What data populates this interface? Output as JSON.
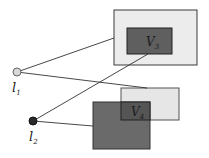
{
  "diagram": {
    "nodes": [
      {
        "id": "l1",
        "label": "l",
        "subscript": "1",
        "fill": "#d8d8d8",
        "cx": 17,
        "cy": 72
      },
      {
        "id": "l2",
        "label": "l",
        "subscript": "2",
        "fill": "#2a2a2a",
        "cx": 33,
        "cy": 121
      }
    ],
    "regions": [
      {
        "id": "V3",
        "label": "V",
        "subscript": "3",
        "outer_fill": "#ececec",
        "inner_fill": "#5f5f5f"
      },
      {
        "id": "V4",
        "label": "V",
        "subscript": "4",
        "light_fill": "#e6e6e6",
        "dark_fill": "#6a6a6a",
        "overlap_fill": "#555555"
      }
    ],
    "edges": [
      {
        "from": "l1",
        "to": "V3-outer-left"
      },
      {
        "from": "l1",
        "to": "V4-light-top"
      },
      {
        "from": "l2",
        "to": "V3-inner-bottom"
      },
      {
        "from": "l2",
        "to": "V4-dark-left"
      }
    ],
    "colors": {
      "stroke": "#3a3a3a",
      "line": "#333333"
    }
  }
}
